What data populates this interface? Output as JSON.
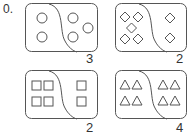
{
  "problem_label": "0.",
  "panels": [
    {
      "shape": "circle",
      "left_count": 2,
      "right_count": 3,
      "answer": "3"
    },
    {
      "shape": "diamond",
      "left_count": 5,
      "right_count": 2,
      "answer": "2"
    },
    {
      "shape": "square",
      "left_count": 4,
      "right_count": 2,
      "answer": "2"
    },
    {
      "shape": "triangle",
      "left_count": 4,
      "right_count": 4,
      "answer": "4"
    }
  ]
}
